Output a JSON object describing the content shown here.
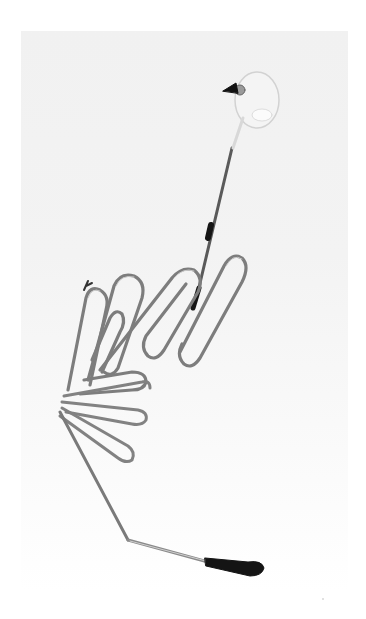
{
  "image": {
    "subject": "wire sculpture of a long-legged bird",
    "description": "Bent metal wire sculpture with looped wire body, thin neck with a clear glass bead head and black beak, and a long bent leg ending in a dark foot",
    "colors": {
      "background": "#ffffff",
      "backdrop": "#f2f2f2",
      "wire": "#7a7a7a",
      "wire_highlight": "#c8c8c8",
      "dark_parts": "#1a1a1a",
      "glass": "#e8e8e8"
    }
  }
}
